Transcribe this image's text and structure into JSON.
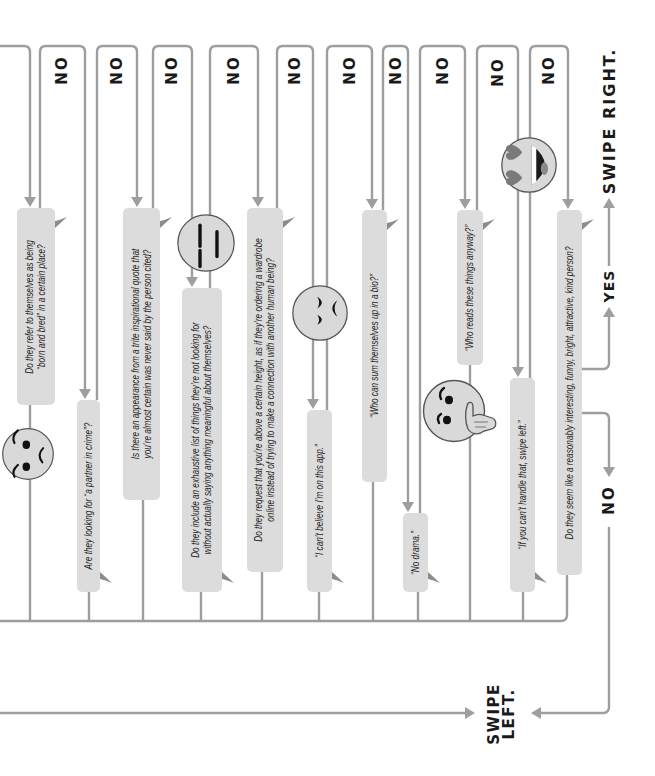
{
  "questions": [
    {
      "lines": [
        "Do they refer to themselves as being",
        "“born and bred” in a certain place?"
      ]
    },
    {
      "lines": [
        "Are they looking for “a partner in crime”?"
      ]
    },
    {
      "lines": [
        "Is there an appearance from a trite inspirational quote that",
        "you’re almost certain was never said by the person cited?"
      ]
    },
    {
      "lines": [
        "Do they include an exhaustive list of things they’re not looking for",
        "without actually saying anything meaningful about themselves?"
      ]
    },
    {
      "lines": [
        "Do they request that you’re above a certain height, as if they’re ordering a wardrobe",
        "online instead of trying to make a connection with another human being?"
      ]
    },
    {
      "lines": [
        "“I can’t believe I’m on this app.”"
      ]
    },
    {
      "lines": [
        "“Who can sum themselves up in a bio?”"
      ]
    },
    {
      "lines": [
        "“No drama.”"
      ]
    },
    {
      "lines": [
        "“Who reads these things anyway?”"
      ]
    },
    {
      "lines": [
        "“If you can’t handle that, swipe left.”"
      ]
    },
    {
      "lines": [
        "Do they seem like a reasonably interesting, funny, bright, attractive, kind person?"
      ]
    }
  ],
  "branch_labels": {
    "no": [
      "NO",
      "NO",
      "NO",
      "NO",
      "NO",
      "NO",
      "NO",
      "NO",
      "NO",
      "NO"
    ],
    "final_yes": "YES",
    "final_no": "NO"
  },
  "outcomes": {
    "swipe_right": "SWIPE RIGHT.",
    "swipe_left": [
      "SWIPE",
      "LEFT."
    ]
  },
  "emojis": [
    "smirking-face",
    "expressionless-face",
    "frowning-face",
    "thinking-face",
    "heart-eyes-laughing-face"
  ],
  "colors": {
    "line": "#9e9e9e",
    "bubble": "#dcdcdc",
    "bubble_tail": "#8c8c8c",
    "emoji_fill": "#d9d9d9",
    "text": "#1c1c1c"
  }
}
